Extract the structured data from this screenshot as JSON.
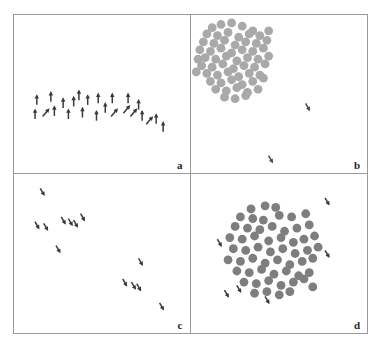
{
  "figure": {
    "title": "",
    "background_color": "#ffffff",
    "border_color": "#9a9a9a",
    "panel_count": 4,
    "layout": "2x2"
  },
  "panels": [
    {
      "id": "panel-a",
      "label": "a",
      "description": "sparse upward-pointing arrow glyphs in a horizontal band",
      "glyph": "arrow",
      "glyph_color": "#3a3a3a",
      "dot_color": "",
      "dot_count": 0,
      "arrow_count": 24
    },
    {
      "id": "panel-b",
      "label": "b",
      "description": "light gray dot cluster in upper-left with two sparse tick marks",
      "glyph": "dot",
      "glyph_color": "#4a4a4a",
      "dot_color": "#a9a9a9",
      "dot_count": 62,
      "arrow_count": 2
    },
    {
      "id": "panel-c",
      "label": "c",
      "description": "short diagonal tick marks arranged along a descending diagonal",
      "glyph": "tick",
      "glyph_color": "#3a3a3a",
      "dot_color": "",
      "dot_count": 0,
      "arrow_count": 13
    },
    {
      "id": "panel-d",
      "label": "d",
      "description": "dark gray dot cluster centered with a few sparse tick marks around it",
      "glyph": "dot",
      "glyph_color": "#3a3a3a",
      "dot_color": "#7e7e7e",
      "dot_count": 58,
      "arrow_count": 6
    }
  ],
  "chart_data": {
    "type": "scatter",
    "title": "",
    "xlabel": "",
    "ylabel": "",
    "xlim": [
      0,
      100
    ],
    "ylim": [
      0,
      100
    ],
    "grid": false,
    "legend": "none",
    "subplots": [
      {
        "panel": "a",
        "marker": "arrow",
        "series": [
          {
            "name": "arrows",
            "color": "#3a3a3a",
            "points": [
              {
                "x": 13,
                "y": 46,
                "angle": 0
              },
              {
                "x": 21,
                "y": 48,
                "angle": 0
              },
              {
                "x": 28,
                "y": 44,
                "angle": 0
              },
              {
                "x": 37,
                "y": 49,
                "angle": 0
              },
              {
                "x": 42,
                "y": 46,
                "angle": 0
              },
              {
                "x": 48,
                "y": 47,
                "angle": 0
              },
              {
                "x": 56,
                "y": 47,
                "angle": 0
              },
              {
                "x": 65,
                "y": 47,
                "angle": 0
              },
              {
                "x": 71,
                "y": 43,
                "angle": 0
              },
              {
                "x": 12,
                "y": 37,
                "angle": 0
              },
              {
                "x": 18,
                "y": 38,
                "angle": 40
              },
              {
                "x": 23,
                "y": 39,
                "angle": 0
              },
              {
                "x": 31,
                "y": 37,
                "angle": 0
              },
              {
                "x": 39,
                "y": 38,
                "angle": 0
              },
              {
                "x": 47,
                "y": 36,
                "angle": 0
              },
              {
                "x": 57,
                "y": 38,
                "angle": 40
              },
              {
                "x": 64,
                "y": 40,
                "angle": 40
              },
              {
                "x": 68,
                "y": 38,
                "angle": 40
              },
              {
                "x": 73,
                "y": 36,
                "angle": 0
              },
              {
                "x": 77,
                "y": 33,
                "angle": 40
              },
              {
                "x": 81,
                "y": 34,
                "angle": 0
              },
              {
                "x": 85,
                "y": 29,
                "angle": 0
              },
              {
                "x": 34,
                "y": 45,
                "angle": 0
              },
              {
                "x": 52,
                "y": 41,
                "angle": 0
              }
            ]
          }
        ]
      },
      {
        "panel": "b",
        "marker": "dot",
        "series": [
          {
            "name": "cluster",
            "color": "#a9a9a9",
            "points": [
              {
                "x": 12,
                "y": 92
              },
              {
                "x": 17,
                "y": 94
              },
              {
                "x": 23,
                "y": 95
              },
              {
                "x": 29,
                "y": 93
              },
              {
                "x": 35,
                "y": 90
              },
              {
                "x": 9,
                "y": 88
              },
              {
                "x": 15,
                "y": 87
              },
              {
                "x": 21,
                "y": 89
              },
              {
                "x": 27,
                "y": 86
              },
              {
                "x": 33,
                "y": 88
              },
              {
                "x": 39,
                "y": 87
              },
              {
                "x": 7,
                "y": 83
              },
              {
                "x": 13,
                "y": 82
              },
              {
                "x": 19,
                "y": 84
              },
              {
                "x": 25,
                "y": 81
              },
              {
                "x": 31,
                "y": 83
              },
              {
                "x": 37,
                "y": 82
              },
              {
                "x": 43,
                "y": 84
              },
              {
                "x": 5,
                "y": 78
              },
              {
                "x": 11,
                "y": 77
              },
              {
                "x": 17,
                "y": 79
              },
              {
                "x": 23,
                "y": 76
              },
              {
                "x": 29,
                "y": 78
              },
              {
                "x": 35,
                "y": 77
              },
              {
                "x": 41,
                "y": 79
              },
              {
                "x": 8,
                "y": 73
              },
              {
                "x": 14,
                "y": 72
              },
              {
                "x": 20,
                "y": 74
              },
              {
                "x": 26,
                "y": 71
              },
              {
                "x": 32,
                "y": 73
              },
              {
                "x": 38,
                "y": 72
              },
              {
                "x": 44,
                "y": 74
              },
              {
                "x": 6,
                "y": 68
              },
              {
                "x": 12,
                "y": 67
              },
              {
                "x": 18,
                "y": 69
              },
              {
                "x": 24,
                "y": 66
              },
              {
                "x": 30,
                "y": 68
              },
              {
                "x": 36,
                "y": 67
              },
              {
                "x": 42,
                "y": 69
              },
              {
                "x": 9,
                "y": 63
              },
              {
                "x": 15,
                "y": 62
              },
              {
                "x": 21,
                "y": 64
              },
              {
                "x": 27,
                "y": 61
              },
              {
                "x": 33,
                "y": 63
              },
              {
                "x": 39,
                "y": 62
              },
              {
                "x": 11,
                "y": 58
              },
              {
                "x": 17,
                "y": 57
              },
              {
                "x": 23,
                "y": 59
              },
              {
                "x": 29,
                "y": 56
              },
              {
                "x": 35,
                "y": 58
              },
              {
                "x": 41,
                "y": 60
              },
              {
                "x": 14,
                "y": 53
              },
              {
                "x": 20,
                "y": 52
              },
              {
                "x": 26,
                "y": 54
              },
              {
                "x": 32,
                "y": 51
              },
              {
                "x": 38,
                "y": 53
              },
              {
                "x": 19,
                "y": 48
              },
              {
                "x": 25,
                "y": 47
              },
              {
                "x": 31,
                "y": 49
              },
              {
                "x": 4,
                "y": 72
              },
              {
                "x": 3,
                "y": 64
              },
              {
                "x": 44,
                "y": 90
              }
            ]
          },
          {
            "name": "sparse-ticks",
            "color": "#4a4a4a",
            "points": [
              {
                "x": 66,
                "y": 42,
                "angle": 150
              },
              {
                "x": 45,
                "y": 9,
                "angle": 150
              }
            ]
          }
        ]
      },
      {
        "panel": "c",
        "marker": "tick",
        "series": [
          {
            "name": "diagonal-ticks",
            "color": "#3a3a3a",
            "points": [
              {
                "x": 16,
                "y": 89,
                "angle": 150
              },
              {
                "x": 13,
                "y": 68,
                "angle": 150
              },
              {
                "x": 18,
                "y": 67,
                "angle": 150
              },
              {
                "x": 28,
                "y": 71,
                "angle": 150
              },
              {
                "x": 32,
                "y": 70,
                "angle": 150
              },
              {
                "x": 39,
                "y": 73,
                "angle": 150
              },
              {
                "x": 25,
                "y": 53,
                "angle": 150
              },
              {
                "x": 72,
                "y": 45,
                "angle": 150
              },
              {
                "x": 63,
                "y": 32,
                "angle": 150
              },
              {
                "x": 68,
                "y": 30,
                "angle": 150
              },
              {
                "x": 71,
                "y": 29,
                "angle": 150
              },
              {
                "x": 84,
                "y": 17,
                "angle": 150
              },
              {
                "x": 35,
                "y": 69,
                "angle": 150
              }
            ]
          }
        ]
      },
      {
        "panel": "d",
        "marker": "dot",
        "series": [
          {
            "name": "cluster",
            "color": "#7e7e7e",
            "points": [
              {
                "x": 34,
                "y": 78
              },
              {
                "x": 42,
                "y": 80
              },
              {
                "x": 48,
                "y": 79
              },
              {
                "x": 28,
                "y": 73
              },
              {
                "x": 35,
                "y": 72
              },
              {
                "x": 41,
                "y": 71
              },
              {
                "x": 50,
                "y": 74
              },
              {
                "x": 57,
                "y": 73
              },
              {
                "x": 65,
                "y": 75
              },
              {
                "x": 25,
                "y": 67
              },
              {
                "x": 32,
                "y": 66
              },
              {
                "x": 39,
                "y": 65
              },
              {
                "x": 46,
                "y": 67
              },
              {
                "x": 53,
                "y": 64
              },
              {
                "x": 60,
                "y": 66
              },
              {
                "x": 67,
                "y": 68
              },
              {
                "x": 22,
                "y": 60
              },
              {
                "x": 29,
                "y": 59
              },
              {
                "x": 36,
                "y": 61
              },
              {
                "x": 44,
                "y": 58
              },
              {
                "x": 51,
                "y": 60
              },
              {
                "x": 58,
                "y": 57
              },
              {
                "x": 64,
                "y": 59
              },
              {
                "x": 70,
                "y": 61
              },
              {
                "x": 24,
                "y": 53
              },
              {
                "x": 31,
                "y": 52
              },
              {
                "x": 38,
                "y": 54
              },
              {
                "x": 45,
                "y": 51
              },
              {
                "x": 52,
                "y": 53
              },
              {
                "x": 59,
                "y": 50
              },
              {
                "x": 66,
                "y": 52
              },
              {
                "x": 72,
                "y": 54
              },
              {
                "x": 21,
                "y": 46
              },
              {
                "x": 28,
                "y": 45
              },
              {
                "x": 35,
                "y": 47
              },
              {
                "x": 42,
                "y": 44
              },
              {
                "x": 49,
                "y": 46
              },
              {
                "x": 56,
                "y": 43
              },
              {
                "x": 63,
                "y": 45
              },
              {
                "x": 69,
                "y": 47
              },
              {
                "x": 26,
                "y": 39
              },
              {
                "x": 33,
                "y": 38
              },
              {
                "x": 40,
                "y": 40
              },
              {
                "x": 47,
                "y": 37
              },
              {
                "x": 54,
                "y": 39
              },
              {
                "x": 61,
                "y": 36
              },
              {
                "x": 67,
                "y": 38
              },
              {
                "x": 30,
                "y": 32
              },
              {
                "x": 37,
                "y": 31
              },
              {
                "x": 44,
                "y": 33
              },
              {
                "x": 51,
                "y": 30
              },
              {
                "x": 58,
                "y": 32
              },
              {
                "x": 64,
                "y": 34
              },
              {
                "x": 36,
                "y": 25
              },
              {
                "x": 43,
                "y": 26
              },
              {
                "x": 50,
                "y": 24
              },
              {
                "x": 56,
                "y": 26
              },
              {
                "x": 69,
                "y": 29
              }
            ]
          },
          {
            "name": "sparse-ticks",
            "color": "#3a3a3a",
            "points": [
              {
                "x": 77,
                "y": 83,
                "angle": 150
              },
              {
                "x": 16,
                "y": 57,
                "angle": 150
              },
              {
                "x": 77,
                "y": 50,
                "angle": 150
              },
              {
                "x": 27,
                "y": 28,
                "angle": 150
              },
              {
                "x": 43,
                "y": 21,
                "angle": 150
              },
              {
                "x": 20,
                "y": 25,
                "angle": 150
              }
            ]
          }
        ]
      }
    ]
  }
}
